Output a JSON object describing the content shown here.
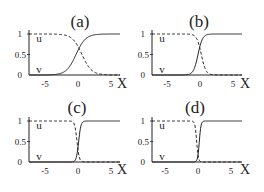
{
  "chart_data": [
    {
      "type": "line",
      "title": "(a)",
      "xlabel": "X",
      "ylabel": "",
      "xticks": [
        "-5",
        "0",
        "5"
      ],
      "yticks": [
        "0",
        "0.5",
        "1"
      ],
      "xlim": [
        -7.4,
        6.5
      ],
      "ylim": [
        0,
        1
      ],
      "series": [
        {
          "name": "u",
          "style": "dashed",
          "shape": "decreasing sigmoid",
          "center": 0.6,
          "width": 1.6
        },
        {
          "name": "v",
          "style": "solid",
          "shape": "increasing sigmoid",
          "center": -0.3,
          "width": 1.6
        }
      ],
      "annotations": [
        "u",
        "v"
      ]
    },
    {
      "type": "line",
      "title": "(b)",
      "xlabel": "X",
      "ylabel": "",
      "xticks": [
        "-5",
        "0",
        "5"
      ],
      "yticks": [
        "0",
        "0.5",
        "1"
      ],
      "xlim": [
        -7.4,
        6.5
      ],
      "ylim": [
        0,
        1
      ],
      "series": [
        {
          "name": "u",
          "style": "dashed",
          "shape": "decreasing sigmoid",
          "center": 0.2,
          "width": 0.75
        },
        {
          "name": "v",
          "style": "solid",
          "shape": "increasing sigmoid",
          "center": -0.3,
          "width": 0.75
        }
      ],
      "annotations": [
        "u",
        "v"
      ]
    },
    {
      "type": "line",
      "title": "(c)",
      "xlabel": "X",
      "ylabel": "",
      "xticks": [
        "-5",
        "0",
        "5"
      ],
      "yticks": [
        "0",
        "0.5",
        "1"
      ],
      "xlim": [
        -7.4,
        6.5
      ],
      "ylim": [
        0,
        1
      ],
      "series": [
        {
          "name": "u",
          "style": "dashed",
          "shape": "decreasing sigmoid",
          "center": -0.15,
          "width": 0.38
        },
        {
          "name": "v",
          "style": "solid",
          "shape": "increasing sigmoid",
          "center": 0.1,
          "width": 0.38
        }
      ],
      "annotations": [
        "u",
        "v"
      ]
    },
    {
      "type": "line",
      "title": "(d)",
      "xlabel": "X",
      "ylabel": "",
      "xticks": [
        "-5",
        "0",
        "5"
      ],
      "yticks": [
        "0",
        "0.5",
        "1"
      ],
      "xlim": [
        -7.4,
        6.5
      ],
      "ylim": [
        0,
        1
      ],
      "series": [
        {
          "name": "u",
          "style": "dashed",
          "shape": "decreasing sigmoid",
          "center": -0.2,
          "width": 0.28
        },
        {
          "name": "v",
          "style": "solid",
          "shape": "increasing sigmoid",
          "center": 0.2,
          "width": 0.28
        }
      ],
      "annotations": [
        "u",
        "v"
      ]
    }
  ],
  "layout": {
    "panels": [
      {
        "ox": 29,
        "x0px": 78,
        "y1px": 34,
        "y0px": 75,
        "xend": 120,
        "titleX": 80,
        "titleY": 27,
        "xlabelX": 122,
        "xlabelY": 88
      },
      {
        "ox": 152,
        "x0px": 200,
        "y1px": 34,
        "y0px": 75,
        "xend": 242,
        "titleX": 199,
        "titleY": 27,
        "xlabelX": 245,
        "xlabelY": 88
      },
      {
        "ox": 29,
        "x0px": 78,
        "y1px": 121,
        "y0px": 162,
        "xend": 120,
        "titleX": 77,
        "titleY": 113,
        "xlabelX": 122,
        "xlabelY": 174
      },
      {
        "ox": 152,
        "x0px": 198,
        "y1px": 121,
        "y0px": 162,
        "xend": 242,
        "titleX": 195,
        "titleY": 113,
        "xlabelX": 245,
        "xlabelY": 174
      }
    ],
    "pxPerUnit": 6.6,
    "lineColor": "#222222"
  }
}
